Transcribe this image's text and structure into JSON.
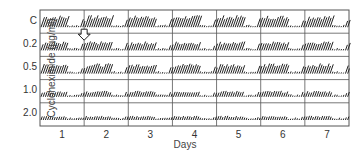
{
  "chart_data": {
    "type": "actogram",
    "title": "",
    "xlabel": "Days",
    "ylabel": "Cycloheximide (µg/ml)",
    "x_ticks": [
      "1",
      "2",
      "3",
      "4",
      "5",
      "6",
      "7"
    ],
    "rows": [
      {
        "label": "C",
        "amplitude": 1.0,
        "activity_days": [
          1,
          2,
          3,
          4,
          5,
          6,
          7
        ]
      },
      {
        "label": "0.2",
        "amplitude": 0.75,
        "activity_days": [
          1,
          2,
          3,
          4,
          5,
          6,
          7
        ]
      },
      {
        "label": "0.5",
        "amplitude": 0.85,
        "activity_days": [
          1,
          2,
          3,
          4,
          5,
          6,
          7
        ]
      },
      {
        "label": "1.0",
        "amplitude": 0.5,
        "activity_days": [
          1,
          2,
          3,
          4,
          5,
          6,
          7
        ]
      },
      {
        "label": "2.0",
        "amplitude": 0.35,
        "activity_days": [
          1,
          2,
          3,
          4,
          5,
          6,
          7
        ]
      }
    ],
    "annotations": [
      {
        "type": "arrow-down",
        "position": "day 1/2 boundary, between rows C and 0.2"
      }
    ],
    "grid": true,
    "frame": {
      "left": 40,
      "top": 10,
      "right": 349,
      "bottom": 126
    }
  },
  "colors": {
    "ink": "#222222",
    "grid": "#555555",
    "background": "#ffffff"
  }
}
